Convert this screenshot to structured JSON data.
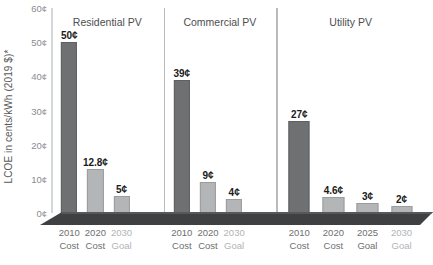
{
  "chart_data": {
    "type": "bar",
    "title": "",
    "subtitle": "",
    "xlabel": "",
    "ylabel": "LCOE in cents/kWh (2019 $)*",
    "ylim": [
      0,
      60
    ],
    "ytick_values": [
      0,
      10,
      20,
      30,
      40,
      50,
      60
    ],
    "ytick_labels": [
      "0¢",
      "10¢",
      "20¢",
      "30¢",
      "40¢",
      "50¢",
      "60¢"
    ],
    "grid": false,
    "legend": "none",
    "value_unit": "¢",
    "groups": [
      {
        "name": "Residential PV",
        "bars": [
          {
            "line1": "2010",
            "line2": "Cost",
            "value": 50,
            "label": "50¢",
            "style": "dark",
            "muted": false
          },
          {
            "line1": "2020",
            "line2": "Cost",
            "value": 12.8,
            "label": "12.8¢",
            "style": "light",
            "muted": false
          },
          {
            "line1": "2030",
            "line2": "Goal",
            "value": 5,
            "label": "5¢",
            "style": "light",
            "muted": true
          }
        ]
      },
      {
        "name": "Commercial PV",
        "bars": [
          {
            "line1": "2010",
            "line2": "Cost",
            "value": 39,
            "label": "39¢",
            "style": "dark",
            "muted": false
          },
          {
            "line1": "2020",
            "line2": "Cost",
            "value": 9,
            "label": "9¢",
            "style": "light",
            "muted": false
          },
          {
            "line1": "2030",
            "line2": "Goal",
            "value": 4,
            "label": "4¢",
            "style": "light",
            "muted": true
          }
        ]
      },
      {
        "name": "Utility PV",
        "bars": [
          {
            "line1": "2010",
            "line2": "Cost",
            "value": 27,
            "label": "27¢",
            "style": "dark",
            "muted": false
          },
          {
            "line1": "2020",
            "line2": "Cost",
            "value": 4.6,
            "label": "4.6¢",
            "style": "light",
            "muted": false
          },
          {
            "line1": "2025",
            "line2": "Goal",
            "value": 3,
            "label": "3¢",
            "style": "light",
            "muted": false
          },
          {
            "line1": "2030",
            "line2": "Goal",
            "value": 2,
            "label": "2¢",
            "style": "light",
            "muted": true
          }
        ]
      }
    ],
    "colors": {
      "bar_dark": "#6e7072",
      "bar_light": "#b3b5b7",
      "platform": "#3f4042",
      "axis": "#d6d7d8",
      "separator": "#b9babc",
      "text": "#58595b",
      "text_muted": "#b1b3b5",
      "value_text": "#1a1a1a",
      "background": "#ffffff"
    }
  }
}
